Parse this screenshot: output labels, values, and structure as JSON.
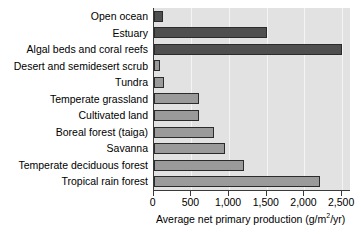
{
  "chart_data": {
    "type": "bar",
    "orientation": "horizontal",
    "title": "",
    "xlabel": "Average net primary production (g/m2/yr)",
    "xlabel_parts": {
      "before": "Average net primary production (g/m",
      "superscript": "2",
      "after": "/yr)"
    },
    "ylabel": "",
    "xlim": [
      0,
      2600
    ],
    "xticks": [
      0,
      500,
      1000,
      1500,
      2000,
      2500
    ],
    "xtick_labels": [
      "0",
      "500",
      "1,000",
      "1,500",
      "2,000",
      "2,500"
    ],
    "grid": true,
    "grid_axis": "x",
    "legend": false,
    "categories": [
      "Open ocean",
      "Estuary",
      "Algal beds and coral reefs",
      "Desert and semidesert scrub",
      "Tundra",
      "Temperate grassland",
      "Cultivated land",
      "Boreal forest (taiga)",
      "Savanna",
      "Temperate deciduous forest",
      "Tropical rain forest"
    ],
    "values": [
      125,
      1500,
      2500,
      90,
      140,
      600,
      600,
      800,
      950,
      1200,
      2200
    ],
    "bar_shades": [
      "dark",
      "dark",
      "dark",
      "light",
      "light",
      "light",
      "light",
      "light",
      "light",
      "light",
      "light"
    ],
    "colors": {
      "bar_dark": "#4f4f4f",
      "bar_light": "#9a9a9a",
      "bar_border": "#2b2b2b",
      "plot_background": "#e2e2e2",
      "gridline": "#f4f4f4",
      "axis": "#3a3a3a",
      "text": "#000000",
      "page_background": "#ffffff"
    }
  }
}
